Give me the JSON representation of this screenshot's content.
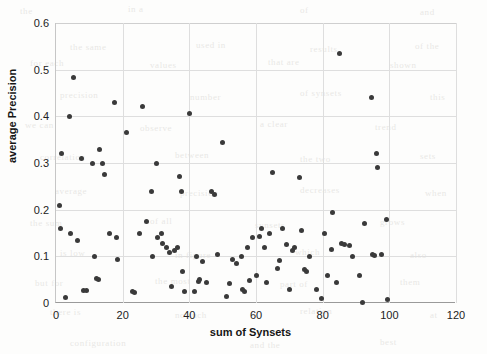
{
  "chart_data": {
    "type": "scatter",
    "title": "",
    "xlabel": "sum of Synsets",
    "ylabel": "average Precision",
    "xlim": [
      0,
      120
    ],
    "ylim": [
      0,
      0.6
    ],
    "xticks": [
      0,
      20,
      40,
      60,
      80,
      100,
      120
    ],
    "xtick_labels": [
      "0",
      "20",
      "40",
      "60",
      "80",
      "100",
      "120"
    ],
    "yticks": [
      0,
      0.1,
      0.2,
      0.3,
      0.4,
      0.5,
      0.6
    ],
    "ytick_labels": [
      "0",
      "0.1",
      "0.2",
      "0.3",
      "0.4",
      "0.5",
      "0.6"
    ],
    "grid": true,
    "legend": null,
    "marker_color": "#3a3a3a",
    "marker_size": 5,
    "series": [
      {
        "name": "average Precision vs sum of Synsets",
        "points": [
          [
            1.0,
            0.21
          ],
          [
            1.2,
            0.16
          ],
          [
            1.5,
            0.32
          ],
          [
            2.8,
            0.012
          ],
          [
            4.0,
            0.4
          ],
          [
            4.4,
            0.15
          ],
          [
            5.2,
            0.483
          ],
          [
            6.5,
            0.133
          ],
          [
            7.5,
            0.31
          ],
          [
            8.3,
            0.026
          ],
          [
            9.2,
            0.026
          ],
          [
            11.0,
            0.298
          ],
          [
            11.5,
            0.1
          ],
          [
            12.2,
            0.053
          ],
          [
            12.6,
            0.05
          ],
          [
            13.0,
            0.33
          ],
          [
            14.0,
            0.3
          ],
          [
            14.6,
            0.275
          ],
          [
            16.0,
            0.148
          ],
          [
            17.5,
            0.43
          ],
          [
            18.0,
            0.141
          ],
          [
            18.4,
            0.093
          ],
          [
            21.0,
            0.365
          ],
          [
            23.0,
            0.025
          ],
          [
            23.5,
            0.022
          ],
          [
            25.0,
            0.148
          ],
          [
            26.0,
            0.422
          ],
          [
            27.0,
            0.175
          ],
          [
            28.5,
            0.24
          ],
          [
            29.0,
            0.1
          ],
          [
            30.0,
            0.3
          ],
          [
            30.5,
            0.14
          ],
          [
            31.5,
            0.148
          ],
          [
            32.0,
            0.128
          ],
          [
            33.0,
            0.118
          ],
          [
            34.0,
            0.108
          ],
          [
            34.6,
            0.036
          ],
          [
            35.5,
            0.112
          ],
          [
            36.5,
            0.118
          ],
          [
            37.0,
            0.272
          ],
          [
            37.5,
            0.24
          ],
          [
            38.0,
            0.068
          ],
          [
            38.6,
            0.025
          ],
          [
            40.0,
            0.407
          ],
          [
            41.5,
            0.025
          ],
          [
            42.0,
            0.1
          ],
          [
            42.6,
            0.047
          ],
          [
            43.0,
            0.05
          ],
          [
            44.0,
            0.09
          ],
          [
            45.0,
            0.043
          ],
          [
            46.5,
            0.24
          ],
          [
            47.5,
            0.232
          ],
          [
            48.5,
            0.103
          ],
          [
            50.0,
            0.345
          ],
          [
            51.0,
            0.013
          ],
          [
            52.0,
            0.041
          ],
          [
            53.0,
            0.093
          ],
          [
            54.0,
            0.085
          ],
          [
            55.5,
            0.1
          ],
          [
            56.0,
            0.03
          ],
          [
            56.6,
            0.025
          ],
          [
            57.5,
            0.12
          ],
          [
            58.0,
            0.048
          ],
          [
            58.8,
            0.14
          ],
          [
            60.0,
            0.06
          ],
          [
            61.0,
            0.142
          ],
          [
            61.5,
            0.16
          ],
          [
            62.5,
            0.118
          ],
          [
            63.0,
            0.045
          ],
          [
            64.0,
            0.148
          ],
          [
            65.0,
            0.28
          ],
          [
            66.5,
            0.075
          ],
          [
            67.0,
            0.092
          ],
          [
            68.0,
            0.16
          ],
          [
            69.0,
            0.126
          ],
          [
            70.0,
            0.03
          ],
          [
            71.0,
            0.112
          ],
          [
            71.5,
            0.118
          ],
          [
            73.0,
            0.27
          ],
          [
            73.5,
            0.155
          ],
          [
            74.5,
            0.072
          ],
          [
            75.0,
            0.068
          ],
          [
            76.0,
            0.1
          ],
          [
            78.0,
            0.028
          ],
          [
            79.5,
            0.01
          ],
          [
            80.5,
            0.148
          ],
          [
            81.5,
            0.06
          ],
          [
            82.5,
            0.115
          ],
          [
            83.0,
            0.195
          ],
          [
            84.0,
            0.043
          ],
          [
            85.0,
            0.535
          ],
          [
            85.5,
            0.128
          ],
          [
            86.5,
            0.125
          ],
          [
            88.0,
            0.123
          ],
          [
            89.0,
            0.1
          ],
          [
            91.0,
            0.06
          ],
          [
            92.0,
            0.002
          ],
          [
            92.5,
            0.17
          ],
          [
            94.5,
            0.44
          ],
          [
            95.0,
            0.105
          ],
          [
            95.5,
            0.102
          ],
          [
            96.0,
            0.32
          ],
          [
            96.5,
            0.29
          ],
          [
            97.5,
            0.103
          ],
          [
            99.0,
            0.178
          ],
          [
            99.5,
            0.008
          ]
        ]
      }
    ]
  },
  "bleed_text": [
    {
      "t": "the",
      "x": 20,
      "y": 6,
      "s": 9
    },
    {
      "t": "in a",
      "x": 128,
      "y": 4,
      "s": 9
    },
    {
      "t": "of",
      "x": 300,
      "y": 5,
      "s": 9
    },
    {
      "t": "and",
      "x": 420,
      "y": 7,
      "s": 9
    },
    {
      "t": "the same",
      "x": 70,
      "y": 42,
      "s": 9
    },
    {
      "t": "used in",
      "x": 196,
      "y": 40,
      "s": 9
    },
    {
      "t": "results",
      "x": 310,
      "y": 44,
      "s": 9
    },
    {
      "t": "of the",
      "x": 415,
      "y": 41,
      "s": 9
    },
    {
      "t": "for each",
      "x": 30,
      "y": 58,
      "s": 9
    },
    {
      "t": "values",
      "x": 150,
      "y": 60,
      "s": 9
    },
    {
      "t": "that are",
      "x": 268,
      "y": 57,
      "s": 9
    },
    {
      "t": "shown",
      "x": 390,
      "y": 60,
      "s": 9
    },
    {
      "t": "precision",
      "x": 60,
      "y": 90,
      "s": 9
    },
    {
      "t": "number",
      "x": 190,
      "y": 92,
      "s": 9
    },
    {
      "t": "of synsets",
      "x": 300,
      "y": 88,
      "s": 9
    },
    {
      "t": "this",
      "x": 430,
      "y": 92,
      "s": 9
    },
    {
      "t": "we can",
      "x": 25,
      "y": 120,
      "s": 9
    },
    {
      "t": "observe",
      "x": 140,
      "y": 123,
      "s": 9
    },
    {
      "t": "a clear",
      "x": 260,
      "y": 119,
      "s": 9
    },
    {
      "t": "trend",
      "x": 375,
      "y": 122,
      "s": 9
    },
    {
      "t": "correlation",
      "x": 40,
      "y": 152,
      "s": 9
    },
    {
      "t": "between",
      "x": 175,
      "y": 150,
      "s": 9
    },
    {
      "t": "the two",
      "x": 300,
      "y": 154,
      "s": 9
    },
    {
      "t": "sets",
      "x": 420,
      "y": 151,
      "s": 9
    },
    {
      "t": "average",
      "x": 55,
      "y": 186,
      "s": 9
    },
    {
      "t": "precision",
      "x": 180,
      "y": 188,
      "s": 9
    },
    {
      "t": "decreases",
      "x": 300,
      "y": 185,
      "s": 9
    },
    {
      "t": "when",
      "x": 425,
      "y": 188,
      "s": 9
    },
    {
      "t": "the sum",
      "x": 30,
      "y": 218,
      "s": 9
    },
    {
      "t": "of all",
      "x": 150,
      "y": 216,
      "s": 9
    },
    {
      "t": "synsets",
      "x": 255,
      "y": 220,
      "s": 9
    },
    {
      "t": "grows",
      "x": 380,
      "y": 217,
      "s": 9
    },
    {
      "t": "is low",
      "x": 60,
      "y": 248,
      "s": 9
    },
    {
      "t": "in figure",
      "x": 175,
      "y": 250,
      "s": 9
    },
    {
      "t": "which",
      "x": 295,
      "y": 247,
      "s": 9
    },
    {
      "t": "also",
      "x": 410,
      "y": 250,
      "s": 9
    },
    {
      "t": "but for",
      "x": 35,
      "y": 278,
      "s": 9
    },
    {
      "t": "the most",
      "x": 155,
      "y": 276,
      "s": 9
    },
    {
      "t": "part of",
      "x": 280,
      "y": 279,
      "s": 9
    },
    {
      "t": "them",
      "x": 400,
      "y": 277,
      "s": 9
    },
    {
      "t": "there is",
      "x": 50,
      "y": 307,
      "s": 9
    },
    {
      "t": "no such",
      "x": 175,
      "y": 310,
      "s": 9
    },
    {
      "t": "relation",
      "x": 300,
      "y": 306,
      "s": 9
    },
    {
      "t": "at",
      "x": 430,
      "y": 310,
      "s": 9
    },
    {
      "t": "configuration",
      "x": 70,
      "y": 338,
      "s": 9
    },
    {
      "t": "and the",
      "x": 250,
      "y": 340,
      "s": 9
    },
    {
      "t": "best",
      "x": 380,
      "y": 337,
      "s": 9
    }
  ]
}
